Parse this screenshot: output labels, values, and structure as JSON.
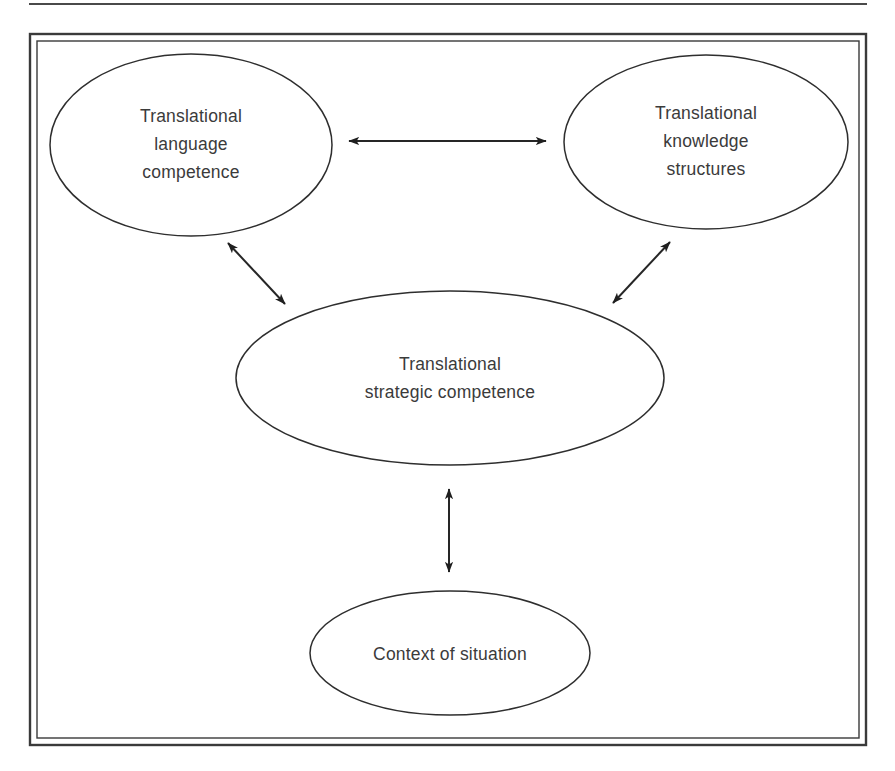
{
  "page": {
    "width": 895,
    "height": 771,
    "background": "#ffffff",
    "ink_color": "#2e2e2e",
    "text_color": "#3b3b3b"
  },
  "top_rule": {
    "name": "horizontal-rule",
    "x1": 29,
    "y1": 4,
    "x2": 867,
    "y2": 4
  },
  "frame": {
    "name": "figure-border",
    "outer": {
      "x": 30,
      "y": 34,
      "width": 836,
      "height": 711
    },
    "inner": {
      "x": 37,
      "y": 41,
      "width": 822,
      "height": 697
    }
  },
  "diagram": {
    "type": "concept-diagram",
    "nodes": [
      {
        "id": "translational-language-competence",
        "shape": "ellipse",
        "cx": 191,
        "cy": 145,
        "rx": 141,
        "ry": 91,
        "lines": [
          "Translational",
          "language",
          "competence"
        ],
        "text": "Translational language competence"
      },
      {
        "id": "translational-knowledge-structures",
        "shape": "ellipse",
        "cx": 706,
        "cy": 142,
        "rx": 142,
        "ry": 87,
        "lines": [
          "Translational",
          "knowledge",
          "structures"
        ],
        "text": "Translational knowledge structures"
      },
      {
        "id": "translational-strategic-competence",
        "shape": "ellipse",
        "cx": 450,
        "cy": 378,
        "rx": 214,
        "ry": 87,
        "lines": [
          "Translational",
          "strategic competence"
        ],
        "text": "Translational strategic competence"
      },
      {
        "id": "context-of-situation",
        "shape": "ellipse",
        "cx": 450,
        "cy": 653,
        "rx": 140,
        "ry": 62,
        "lines": [
          "Context of situation"
        ],
        "text": "Context of situation"
      }
    ],
    "connectors": [
      {
        "id": "language-to-knowledge",
        "style": "double-headed-arrow",
        "orientation": "horizontal",
        "from": "translational-language-competence",
        "to": "translational-knowledge-structures",
        "x1": 349,
        "y1": 141,
        "x2": 546,
        "y2": 141
      },
      {
        "id": "language-to-strategic",
        "style": "double-headed-arrow",
        "orientation": "diagonal",
        "from": "translational-language-competence",
        "to": "translational-strategic-competence",
        "x1": 228,
        "y1": 243,
        "x2": 285,
        "y2": 304
      },
      {
        "id": "knowledge-to-strategic",
        "style": "double-headed-arrow",
        "orientation": "diagonal",
        "from": "translational-knowledge-structures",
        "to": "translational-strategic-competence",
        "x1": 670,
        "y1": 242,
        "x2": 613,
        "y2": 303
      },
      {
        "id": "strategic-to-context",
        "style": "double-headed-arrow",
        "orientation": "vertical",
        "from": "translational-strategic-competence",
        "to": "context-of-situation",
        "x1": 449,
        "y1": 489,
        "x2": 449,
        "y2": 572
      }
    ]
  }
}
